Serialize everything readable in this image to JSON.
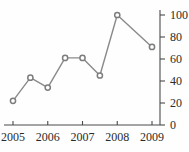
{
  "chart_data": {
    "type": "line",
    "title": "",
    "xlabel": "",
    "ylabel": "",
    "x": [
      2005,
      2005.5,
      2006,
      2006.5,
      2007,
      2007.5,
      2008,
      2009
    ],
    "values": [
      22,
      43,
      34,
      61,
      61,
      45,
      100,
      71
    ],
    "series": [
      {
        "name": "series-1",
        "values": [
          22,
          43,
          34,
          61,
          61,
          45,
          100,
          71
        ]
      }
    ],
    "xlim": [
      2005,
      2009
    ],
    "ylim": [
      0,
      100
    ],
    "x_tick_labels": [
      "2005",
      "2006",
      "2007",
      "2008",
      "2009"
    ],
    "x_tick_values": [
      2005,
      2006,
      2007,
      2008,
      2009
    ],
    "y_tick_labels": [
      "0",
      "20",
      "40",
      "60",
      "80",
      "100"
    ],
    "y_tick_values": [
      0,
      20,
      40,
      60,
      80,
      100
    ],
    "grid": false,
    "legend": "none",
    "y_axis_position": "right",
    "marker": "open-circle",
    "line_color": "#8a8a8a",
    "marker_fill": "#ffffff",
    "marker_stroke": "#7d7d7d",
    "axis_color": "#4a4a4a",
    "background_color": "#fefefe"
  }
}
